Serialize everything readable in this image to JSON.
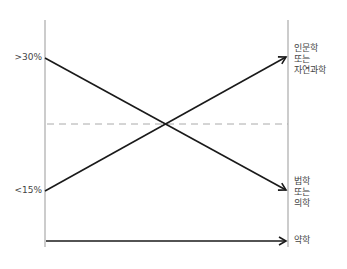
{
  "diagram": {
    "left_axis": {
      "labels": [
        {
          "text": ">30%",
          "y": 58
        },
        {
          "text": "<15%",
          "y": 191
        }
      ]
    },
    "right_labels": {
      "top": [
        "인문학",
        "또는",
        "자연과학"
      ],
      "middle": [
        "법학",
        "또는",
        "의학"
      ],
      "bottom": [
        "약학"
      ]
    },
    "lines": [
      {
        "name": "rising-arrow",
        "from": [
          45,
          191
        ],
        "to": [
          287,
          57
        ],
        "style": "solid"
      },
      {
        "name": "falling-arrow",
        "from": [
          45,
          58
        ],
        "to": [
          287,
          190
        ],
        "style": "solid"
      },
      {
        "name": "flat-arrow",
        "from": [
          45,
          241
        ],
        "to": [
          287,
          241
        ],
        "style": "solid"
      },
      {
        "name": "reference-dashed-line",
        "from": [
          45,
          124
        ],
        "to": [
          288,
          124
        ],
        "style": "dashed"
      }
    ],
    "colors": {
      "axis": "#999999",
      "line": "#1a1a1a",
      "dashed": "#aaaaaa",
      "text": "#444444"
    }
  }
}
